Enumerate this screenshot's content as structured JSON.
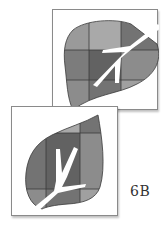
{
  "figure": {
    "label": "6B",
    "panels": [
      {
        "name": "top-panel",
        "description": "Leaf shape divided into 3x3 gray tiles with white branch vein; stem toward upper-right"
      },
      {
        "name": "bottom-panel",
        "description": "Leaf shape divided into 3x3 gray tiles with white branch vein; stem toward lower-left"
      }
    ],
    "colors": {
      "tile_light": "#a9a9a9",
      "tile_mid": "#8c8c8c",
      "tile_dark": "#737373",
      "tile_darkest": "#626262",
      "grid_line": "#3a3a3a",
      "vein": "#ffffff",
      "frame_border": "#8a8a8a"
    }
  }
}
